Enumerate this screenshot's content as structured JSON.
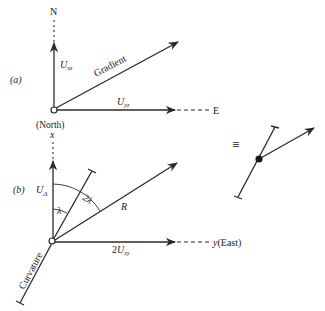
{
  "panel_a": {
    "label": "(a)",
    "north_label": "N",
    "east_label": "E",
    "vertical_component": {
      "base": "U",
      "sub": "xz"
    },
    "horizontal_component": {
      "base": "U",
      "sub": "yz"
    },
    "gradient_label": "Gradient",
    "origin_caption": "(North)"
  },
  "panel_b": {
    "label": "(b)",
    "x_axis_label": "x",
    "y_axis_label": "y",
    "y_axis_suffix": "(East)",
    "delta_component": {
      "base": "U",
      "sub": "Δ"
    },
    "lambda_label": "λ",
    "two_lambda_label": "2λ",
    "resultant_label": "R",
    "horizontal_component": {
      "prefix": "2",
      "base": "U",
      "sub": "xy"
    },
    "curvature_label": "Curvature"
  },
  "equivalence": {
    "symbol": "≡"
  },
  "colors": {
    "ink": "#2a2a2a",
    "background": "#ffffff"
  }
}
